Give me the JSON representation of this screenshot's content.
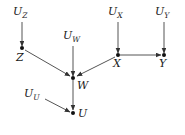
{
  "diagram": {
    "type": "causal-dag",
    "stroke_color": "#555555",
    "text_color": "#1a1a1a",
    "node_color": "#111111",
    "background": "#ffffff",
    "nodes": [
      {
        "id": "Z",
        "label": "Z",
        "x": 22,
        "y": 48,
        "label_x": 16,
        "label_y": 52
      },
      {
        "id": "W",
        "label": "W",
        "x": 73,
        "y": 78,
        "label_x": 77,
        "label_y": 80
      },
      {
        "id": "U",
        "label": "U",
        "x": 73,
        "y": 113,
        "label_x": 78,
        "label_y": 108
      },
      {
        "id": "X",
        "label": "X",
        "x": 118,
        "y": 55,
        "label_x": 113,
        "label_y": 58
      },
      {
        "id": "Y",
        "label": "Y",
        "x": 164,
        "y": 55,
        "label_x": 159,
        "label_y": 58
      }
    ],
    "noise_nodes": [
      {
        "id": "U_Z",
        "base": "U",
        "sub": "Z",
        "label_x": 13,
        "label_y": 6
      },
      {
        "id": "U_W",
        "base": "U",
        "sub": "W",
        "label_x": 63,
        "label_y": 30
      },
      {
        "id": "U_X",
        "base": "U",
        "sub": "X",
        "label_x": 108,
        "label_y": 6
      },
      {
        "id": "U_Y",
        "base": "U",
        "sub": "Y",
        "label_x": 155,
        "label_y": 6
      },
      {
        "id": "U_U",
        "base": "U",
        "sub": "U",
        "label_x": 24,
        "label_y": 88
      }
    ],
    "edges": [
      {
        "from": "U_Z",
        "to": "Z",
        "x1": 22,
        "y1": 22,
        "x2": 22,
        "y2": 46
      },
      {
        "from": "U_W",
        "to": "W",
        "x1": 73,
        "y1": 46,
        "x2": 73,
        "y2": 76
      },
      {
        "from": "U_X",
        "to": "X",
        "x1": 118,
        "y1": 22,
        "x2": 118,
        "y2": 53
      },
      {
        "from": "U_Y",
        "to": "Y",
        "x1": 164,
        "y1": 22,
        "x2": 164,
        "y2": 53
      },
      {
        "from": "U_U",
        "to": "U",
        "x1": 45,
        "y1": 99,
        "x2": 70,
        "y2": 112
      },
      {
        "from": "Z",
        "to": "W",
        "x1": 25,
        "y1": 50,
        "x2": 70,
        "y2": 76
      },
      {
        "from": "X",
        "to": "W",
        "x1": 115,
        "y1": 57,
        "x2": 77,
        "y2": 76
      },
      {
        "from": "X",
        "to": "Y",
        "x1": 120,
        "y1": 55,
        "x2": 161,
        "y2": 55
      },
      {
        "from": "W",
        "to": "U",
        "x1": 73,
        "y1": 80,
        "x2": 73,
        "y2": 110
      }
    ]
  }
}
